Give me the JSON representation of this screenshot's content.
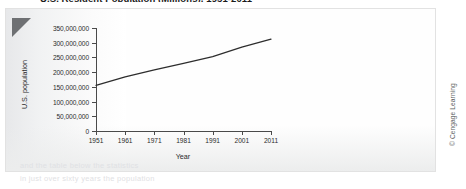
{
  "figure": {
    "title_clipped": "U.S. Resident Population (Millions), 1951-2011",
    "copyright": "© Cengage Learning",
    "corner_fold_icon": "page-corner-fold",
    "bleed_through": {
      "line1": "and the table below the statistics",
      "line2": "in just over sixty years the population"
    }
  },
  "chart_data": {
    "type": "line",
    "title": "U.S. Resident Population (Millions), 1951-2011",
    "xlabel": "Year",
    "ylabel": "U.S. population",
    "grid": false,
    "legend": "none",
    "xlim": [
      1951,
      2011
    ],
    "ylim": [
      0,
      350000000
    ],
    "xticks": [
      1951,
      1961,
      1971,
      1981,
      1991,
      2001,
      2011
    ],
    "xtick_labels": [
      "1951",
      "1961",
      "1971",
      "1981",
      "1991",
      "2001",
      "2011"
    ],
    "yticks": [
      0,
      50000000,
      100000000,
      150000000,
      200000000,
      250000000,
      300000000,
      350000000
    ],
    "ytick_labels": [
      "0",
      "50,000,000",
      "100,000,000",
      "150,000,000",
      "200,000,000",
      "250,000,000",
      "300,000,000",
      "350,000,000"
    ],
    "series": [
      {
        "name": "U.S. population",
        "color": "#2d2d2d",
        "x": [
          1951,
          1961,
          1971,
          1981,
          1991,
          2001,
          2011
        ],
        "values": [
          155000000,
          184000000,
          208000000,
          230000000,
          253000000,
          285000000,
          312000000
        ]
      }
    ]
  }
}
